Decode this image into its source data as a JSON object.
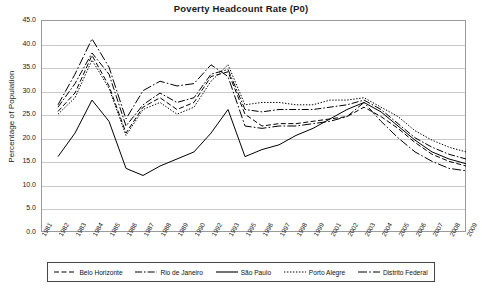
{
  "chart_data": {
    "type": "line",
    "title": "Poverty Headcount Rate (P0)",
    "xlabel": "",
    "ylabel": "Percentage of Population",
    "ylim": [
      0.0,
      45.0
    ],
    "ytick_step": 5.0,
    "yticks": [
      "0.0",
      "5.0",
      "10.0",
      "15.0",
      "20.0",
      "25.0",
      "30.0",
      "35.0",
      "40.0",
      "45.0"
    ],
    "grid": true,
    "legend_position": "bottom",
    "categories": [
      "1981",
      "1982",
      "1983",
      "1984",
      "1985",
      "1986",
      "1987",
      "1988",
      "1989",
      "1990",
      "1992",
      "1993",
      "1995",
      "1996",
      "1997",
      "1998",
      "1999",
      "2001",
      "2002",
      "2003",
      "2004",
      "2005",
      "2006",
      "2007",
      "2008",
      "2009"
    ],
    "note_missing_years": [
      "1994",
      "2000"
    ],
    "series": [
      {
        "name": "Belo Horizonte",
        "style": "dashed",
        "values": [
          null,
          25.6,
          29.5,
          37.5,
          31.0,
          21.0,
          26.5,
          28.5,
          26.0,
          27.5,
          33.0,
          34.0,
          25.0,
          22.5,
          23.0,
          23.0,
          23.5,
          24.0,
          24.5,
          26.5,
          24.5,
          22.0,
          19.0,
          16.5,
          15.0,
          14.0
        ]
      },
      {
        "name": "Rio de Janeiro",
        "style": "dash-dot",
        "values": [
          null,
          26.5,
          31.5,
          38.0,
          33.5,
          22.5,
          27.0,
          29.5,
          27.5,
          28.5,
          33.5,
          34.5,
          26.0,
          25.5,
          26.0,
          26.0,
          26.0,
          26.5,
          27.0,
          28.0,
          26.0,
          23.0,
          20.0,
          18.0,
          16.5,
          15.5
        ]
      },
      {
        "name": "São Paulo",
        "style": "solid",
        "values": [
          null,
          16.0,
          21.0,
          28.0,
          23.5,
          13.5,
          12.0,
          14.0,
          15.5,
          17.0,
          21.0,
          26.0,
          16.0,
          17.5,
          18.5,
          20.5,
          22.0,
          24.0,
          26.0,
          27.5,
          25.5,
          22.5,
          19.5,
          17.0,
          15.5,
          14.5
        ]
      },
      {
        "name": "Porto Alegre",
        "style": "dotted",
        "values": [
          null,
          25.0,
          28.5,
          36.5,
          30.5,
          20.5,
          26.0,
          27.5,
          25.0,
          26.5,
          32.0,
          35.5,
          27.0,
          27.5,
          27.5,
          27.0,
          27.0,
          28.0,
          28.0,
          28.5,
          26.5,
          24.5,
          21.5,
          19.5,
          18.0,
          17.0
        ]
      },
      {
        "name": "Distrito Federal",
        "style": "dash-dot-long",
        "values": [
          null,
          27.0,
          33.5,
          41.0,
          35.0,
          24.0,
          30.0,
          32.0,
          31.0,
          31.5,
          35.5,
          33.0,
          22.5,
          22.0,
          22.5,
          22.5,
          23.0,
          23.5,
          24.5,
          27.5,
          23.5,
          20.0,
          17.0,
          15.0,
          13.5,
          13.0
        ]
      }
    ]
  }
}
